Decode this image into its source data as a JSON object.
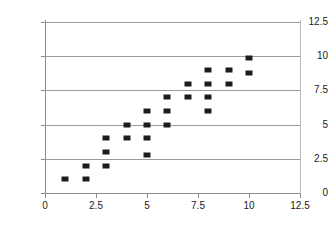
{
  "chart_data": {
    "type": "scatter",
    "title": "",
    "subtitle": "",
    "xlabel": "",
    "ylabel": "",
    "xlim": [
      0,
      12.5
    ],
    "ylim": [
      0,
      12.5
    ],
    "xticks": [
      "0",
      "2.5",
      "5",
      "7.5",
      "10",
      "12.5"
    ],
    "xtick_values": [
      0,
      2.5,
      5,
      7.5,
      10,
      12.5
    ],
    "yticks": [
      "0",
      "2.5",
      "5",
      "7.5",
      "10",
      "12.5"
    ],
    "ytick_values": [
      0,
      2.5,
      5,
      7.5,
      10,
      12.5
    ],
    "grid": "horizontal",
    "legend": "none",
    "marker_color": "#1c1c1c",
    "marker_shape": "square",
    "series": [
      {
        "name": "",
        "points": [
          [
            1,
            1
          ],
          [
            2,
            1
          ],
          [
            2,
            2
          ],
          [
            3,
            2
          ],
          [
            3,
            3
          ],
          [
            3,
            4
          ],
          [
            4,
            4
          ],
          [
            4,
            5
          ],
          [
            5,
            2.8
          ],
          [
            5,
            4
          ],
          [
            5,
            5
          ],
          [
            5,
            6
          ],
          [
            6,
            5
          ],
          [
            6,
            6
          ],
          [
            6,
            7
          ],
          [
            7,
            7
          ],
          [
            7,
            8
          ],
          [
            8,
            6
          ],
          [
            8,
            7
          ],
          [
            8,
            8
          ],
          [
            8,
            9
          ],
          [
            9,
            8
          ],
          [
            9,
            9
          ],
          [
            10,
            8.8
          ],
          [
            10,
            9.9
          ]
        ]
      }
    ]
  },
  "axes": {
    "background_color": "#ffffff",
    "gridline_color": "#9a9a9a",
    "axis_color": "#8c8c8c"
  }
}
